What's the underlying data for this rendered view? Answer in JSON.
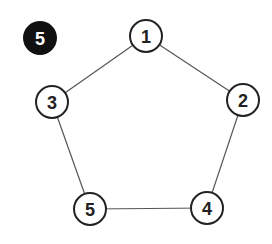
{
  "badge": {
    "label": "5",
    "x": 40,
    "y": 38,
    "r": 17,
    "color": "#111111"
  },
  "nodes": [
    {
      "label": "1",
      "x": 146,
      "y": 36
    },
    {
      "label": "2",
      "x": 243,
      "y": 100
    },
    {
      "label": "3",
      "x": 52,
      "y": 102
    },
    {
      "label": "4",
      "x": 207,
      "y": 208
    },
    {
      "label": "5",
      "x": 90,
      "y": 209
    }
  ],
  "edges": [
    [
      "1",
      "2"
    ],
    [
      "1",
      "3"
    ],
    [
      "3",
      "5"
    ],
    [
      "5",
      "4"
    ],
    [
      "4",
      "2"
    ]
  ],
  "node_radius": 16
}
